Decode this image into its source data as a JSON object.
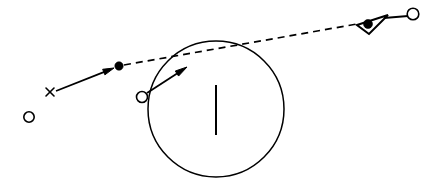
{
  "figure": {
    "title": "",
    "background_color": "#ffffff",
    "ink_color": "#000000",
    "canvas": {
      "width": 439,
      "height": 189
    },
    "elements": [
      {
        "name": "large-circle",
        "kind": "circle-outline",
        "cx": 216,
        "cy": 109,
        "r": 68,
        "stroke_width": 1.5,
        "fill": "none",
        "stroke": "#000000"
      },
      {
        "name": "vertical-bar",
        "kind": "line",
        "x1": 216,
        "y1": 85,
        "x2": 216,
        "y2": 135,
        "stroke_width": 2.0,
        "stroke": "#000000"
      },
      {
        "name": "x-marker",
        "kind": "x-glyph",
        "cx": 50,
        "cy": 92,
        "size": 5,
        "stroke": "#000000"
      },
      {
        "name": "solid-arrow-left",
        "kind": "arrow",
        "x1": 56,
        "y1": 91,
        "x2": 114,
        "y2": 68,
        "stroke_width": 1.8,
        "head_length": 11,
        "head_width": 6,
        "stroke": "#000000"
      },
      {
        "name": "filled-dot-left",
        "kind": "filled-circle",
        "cx": 119,
        "cy": 66,
        "r": 4.2,
        "fill": "#000000"
      },
      {
        "name": "dashed-trajectory",
        "kind": "dashed-line",
        "x1": 124,
        "y1": 65,
        "x2": 357,
        "y2": 24,
        "stroke_width": 1.7,
        "dash": "7 5",
        "stroke": "#000000"
      },
      {
        "name": "triangle-marker",
        "kind": "triangle-outline",
        "points": "357,25 388,15 369,34",
        "stroke_width": 2.0,
        "fill": "none",
        "stroke": "#000000"
      },
      {
        "name": "filled-dot-in-triangle",
        "kind": "filled-circle",
        "cx": 368,
        "cy": 24,
        "r": 4.5,
        "fill": "#000000"
      },
      {
        "name": "triangle-to-circle-line",
        "kind": "line",
        "x1": 384,
        "y1": 18,
        "x2": 408,
        "y2": 16,
        "stroke_width": 1.8,
        "stroke": "#000000"
      },
      {
        "name": "open-circle-top-right",
        "kind": "open-circle",
        "cx": 413,
        "cy": 14,
        "r": 5.8,
        "stroke_width": 1.6,
        "fill": "#ffffff",
        "stroke": "#000000"
      },
      {
        "name": "open-circle-origin",
        "kind": "open-circle",
        "cx": 142,
        "cy": 97,
        "r": 5.5,
        "stroke_width": 1.6,
        "fill": "#ffffff",
        "stroke": "#000000"
      },
      {
        "name": "solid-arrow-into-circle",
        "kind": "arrow",
        "x1": 147,
        "y1": 93,
        "x2": 187,
        "y2": 67,
        "stroke_width": 1.8,
        "head_length": 12,
        "head_width": 6,
        "stroke": "#000000"
      },
      {
        "name": "open-circle-lower-left",
        "kind": "open-circle",
        "cx": 29,
        "cy": 117,
        "r": 5.2,
        "stroke_width": 1.6,
        "fill": "#ffffff",
        "stroke": "#000000"
      }
    ]
  }
}
